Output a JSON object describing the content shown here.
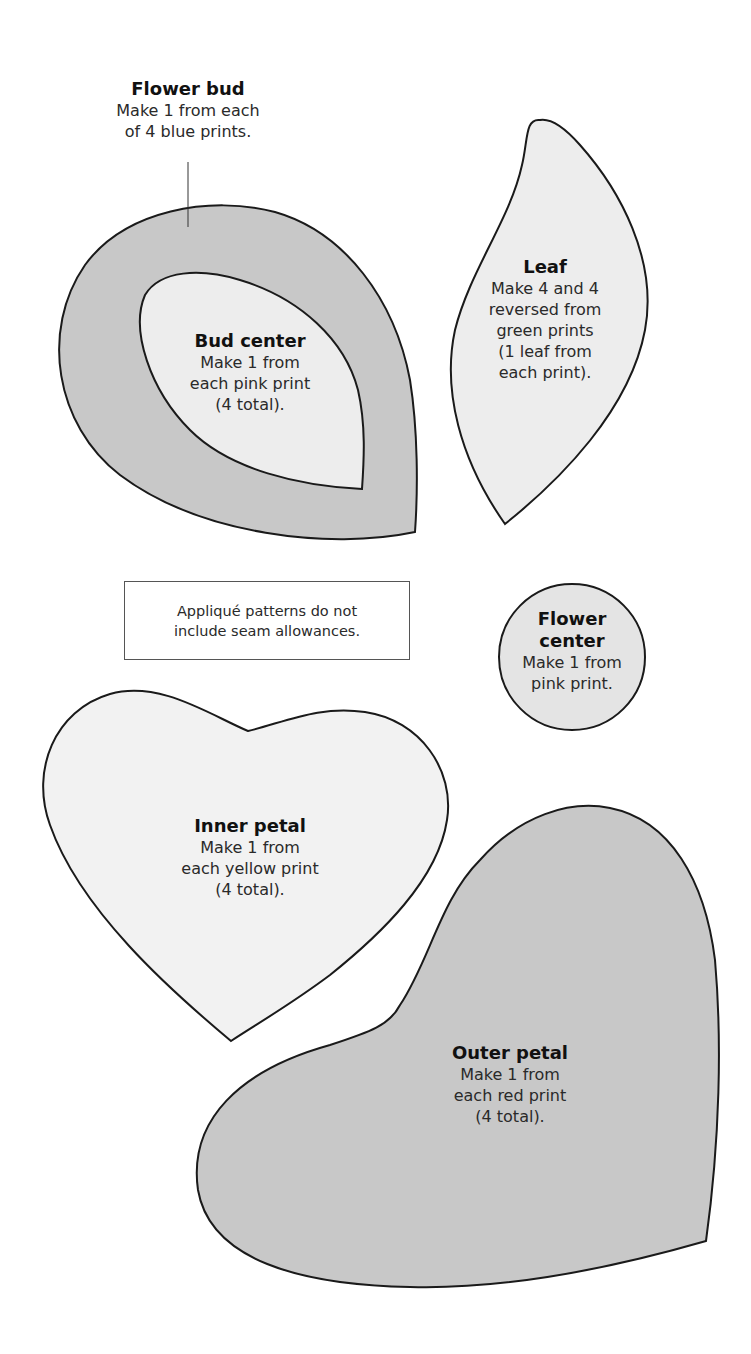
{
  "colors": {
    "dark_fill": "#c8c8c8",
    "light_fill": "#ededed",
    "outline": "#1a1a1a"
  },
  "pieces": {
    "flower_bud": {
      "title": "Flower bud",
      "lines": [
        "Make 1 from each",
        "of 4 blue prints."
      ]
    },
    "bud_center": {
      "title": "Bud center",
      "lines": [
        "Make 1 from",
        "each pink print",
        "(4 total)."
      ]
    },
    "leaf": {
      "title": "Leaf",
      "lines": [
        "Make 4 and 4",
        "reversed from",
        "green prints",
        "(1 leaf from",
        "each print)."
      ]
    },
    "flower_center": {
      "title_lines": [
        "Flower",
        "center"
      ],
      "lines": [
        "Make 1 from",
        "pink print."
      ]
    },
    "inner_petal": {
      "title": "Inner petal",
      "lines": [
        "Make 1 from",
        "each yellow print",
        "(4 total)."
      ]
    },
    "outer_petal": {
      "title": "Outer petal",
      "lines": [
        "Make 1 from",
        "each red print",
        "(4 total)."
      ]
    }
  },
  "note": {
    "lines": [
      "Appliqué patterns do not",
      "include seam allowances."
    ]
  }
}
